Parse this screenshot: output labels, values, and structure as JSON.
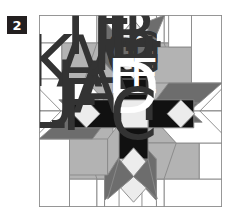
{
  "figure": {
    "step_number": "2",
    "colors": {
      "white": "#ffffff",
      "light_gray": "#b3b3b3",
      "mid_gray": "#6d6d6d",
      "pale": "#ececec",
      "black": "#111111",
      "line": "#8a8a8a"
    },
    "piece_labels": {
      "I": "I",
      "K": "K",
      "A1": "A",
      "A2": "A",
      "A3": "A",
      "J1": "J",
      "J2": "J",
      "L1": "L",
      "L2": "L",
      "L3": "L",
      "L4": "L",
      "F1": "F",
      "F2": "F",
      "B": "B",
      "G1": "G",
      "G2": "G",
      "G3": "G",
      "G4": "G",
      "H1": "H",
      "H2": "H",
      "E1": "E",
      "E2": "E",
      "D": "D",
      "C": "C"
    }
  }
}
